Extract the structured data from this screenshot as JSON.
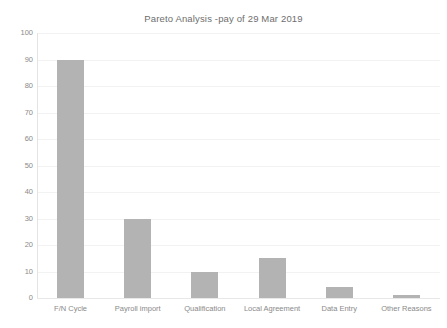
{
  "chart_data": {
    "type": "bar",
    "title": "Pareto Analysis -pay of 29 Mar 2019",
    "xlabel": "",
    "ylabel": "",
    "categories": [
      "F/N Cycle",
      "Payroll import",
      "Qualification",
      "Local Agreement",
      "Data Entry",
      "Other Reasons"
    ],
    "values": [
      90,
      30,
      10,
      15,
      4,
      1
    ],
    "ylim": [
      0,
      100
    ],
    "ytick_step": 10,
    "yticks": [
      "100",
      "90",
      "80",
      "70",
      "60",
      "50",
      "40",
      "30",
      "20",
      "10",
      "0"
    ],
    "grid": true,
    "legend": "none",
    "bar_color": "#b3b3b3",
    "background_color": "#ffffff",
    "text_color": "#8a8a8a",
    "gridline_color": "#f2f2f2"
  }
}
